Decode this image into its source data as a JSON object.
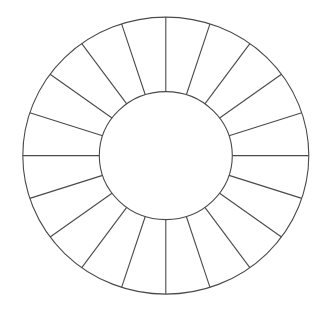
{
  "diagram": {
    "type": "segmented-ring",
    "segment_count": 20,
    "segment_angle_deg": 18,
    "start_angle_deg": 0,
    "segments_labeled": false,
    "center_empty": true,
    "colors": {
      "background": "#ffffff",
      "stroke": "#4a4a4a",
      "fill": "#ffffff"
    },
    "geometry": {
      "cx": 165.8,
      "cy": 155.6,
      "outer_rx": 143,
      "outer_ry": 138.5,
      "inner_rx": 66.5,
      "inner_ry": 64,
      "stroke_width": 1.1
    }
  }
}
